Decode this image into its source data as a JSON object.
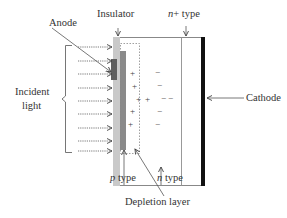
{
  "diagram": {
    "type": "PIN photodiode cross-section",
    "labels": {
      "anode": "Anode",
      "insulator": "Insulator",
      "n_plus_prefix": "n",
      "n_plus_suffix": "+ type",
      "incident_light_line1": "Incident",
      "incident_light_line2": "light",
      "cathode": "Cathode",
      "p_type_prefix": "p",
      "p_type_suffix": " type",
      "n_type_prefix": "n",
      "n_type_suffix": " type",
      "depletion_layer": "Depletion layer"
    },
    "charges": {
      "plus": [
        "+",
        "+",
        "+",
        "+",
        "+",
        "+"
      ],
      "minus": [
        "−",
        "−",
        "−",
        "−",
        "−",
        "−"
      ]
    },
    "light_arrows_count": 9,
    "colors": {
      "insulator": "#c9c9c9",
      "p_type": "#8a8a8a",
      "anode": "#5e5e5e",
      "cathode": "#111111",
      "lines": "#777777",
      "arrows": "#555555"
    }
  }
}
